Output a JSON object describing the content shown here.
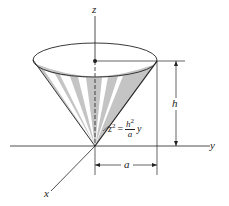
{
  "diagram": {
    "type": "3d-cone-figure",
    "axes": {
      "z_label": "z",
      "y_label": "y",
      "x_label": "x"
    },
    "dimensions": {
      "height_label": "h",
      "radius_label": "a"
    },
    "equation": {
      "lhs": "z",
      "lhs_exp": "2",
      "equals": "=",
      "numerator": "h",
      "numerator_exp": "2",
      "denominator": "a",
      "trailing": "y"
    },
    "colors": {
      "line": "#222222",
      "shade": "#b8b8b8",
      "background": "#ffffff"
    }
  }
}
